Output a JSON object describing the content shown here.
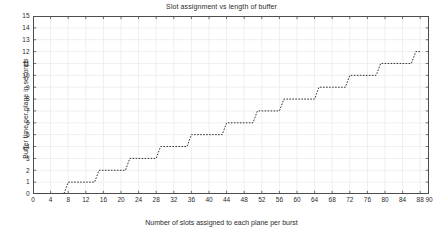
{
  "chart_data": {
    "type": "line",
    "title": "Slot assignment vs length of buffer",
    "xlabel": "Number of slots assigned to each plane per burst",
    "ylabel": "Buffer time per plane in seconds",
    "xlim": [
      0,
      90
    ],
    "ylim": [
      0,
      15
    ],
    "xticks": [
      0,
      4,
      8,
      12,
      16,
      20,
      24,
      28,
      32,
      36,
      40,
      44,
      48,
      52,
      56,
      60,
      64,
      68,
      72,
      76,
      80,
      84,
      88,
      90
    ],
    "yticks": [
      0,
      1,
      2,
      3,
      4,
      5,
      6,
      7,
      8,
      9,
      10,
      11,
      12,
      13,
      14,
      15
    ],
    "grid": true,
    "legend": null,
    "line_style": "dotted-staircase",
    "line_color": "#333333",
    "series": [
      {
        "name": "buffer time",
        "x": [
          1,
          2,
          3,
          4,
          5,
          6,
          7,
          8,
          9,
          10,
          11,
          12,
          13,
          14,
          15,
          16,
          17,
          18,
          19,
          20,
          21,
          22,
          23,
          24,
          25,
          26,
          27,
          28,
          29,
          30,
          31,
          32,
          33,
          34,
          35,
          36,
          37,
          38,
          39,
          40,
          41,
          42,
          43,
          44,
          45,
          46,
          47,
          48,
          49,
          50,
          51,
          52,
          53,
          54,
          55,
          56,
          57,
          58,
          59,
          60,
          61,
          62,
          63,
          64,
          65,
          66,
          67,
          68,
          69,
          70,
          71,
          72,
          73,
          74,
          75,
          76,
          77,
          78,
          79,
          80,
          81,
          82,
          83,
          84,
          85,
          86,
          87,
          88
        ],
        "y": [
          0,
          0,
          0,
          0,
          0,
          0,
          0,
          1,
          1,
          1,
          1,
          1,
          1,
          1,
          2,
          2,
          2,
          2,
          2,
          2,
          2,
          3,
          3,
          3,
          3,
          3,
          3,
          3,
          4,
          4,
          4,
          4,
          4,
          4,
          4,
          5,
          5,
          5,
          5,
          5,
          5,
          5,
          5,
          6,
          6,
          6,
          6,
          6,
          6,
          6,
          7,
          7,
          7,
          7,
          7,
          7,
          8,
          8,
          8,
          8,
          8,
          8,
          8,
          8,
          9,
          9,
          9,
          9,
          9,
          9,
          9,
          10,
          10,
          10,
          10,
          10,
          10,
          10,
          11,
          11,
          11,
          11,
          11,
          11,
          11,
          11,
          12,
          12
        ]
      }
    ],
    "steps": [
      {
        "level": 0,
        "x_start": 1,
        "x_end": 7
      },
      {
        "level": 1,
        "x_start": 8,
        "x_end": 14
      },
      {
        "level": 2,
        "x_start": 15,
        "x_end": 21
      },
      {
        "level": 3,
        "x_start": 22,
        "x_end": 28
      },
      {
        "level": 4,
        "x_start": 29,
        "x_end": 35
      },
      {
        "level": 5,
        "x_start": 36,
        "x_end": 43
      },
      {
        "level": 6,
        "x_start": 44,
        "x_end": 50
      },
      {
        "level": 7,
        "x_start": 51,
        "x_end": 56
      },
      {
        "level": 8,
        "x_start": 57,
        "x_end": 64
      },
      {
        "level": 9,
        "x_start": 65,
        "x_end": 71
      },
      {
        "level": 10,
        "x_start": 72,
        "x_end": 78
      },
      {
        "level": 11,
        "x_start": 79,
        "x_end": 86
      },
      {
        "level": 12,
        "x_start": 87,
        "x_end": 88
      }
    ]
  },
  "figure": {
    "background_color": "#ffffff",
    "axis_color": "#4d4d4d",
    "grid_color": "#efefef",
    "text_color": "#2b2b2b"
  }
}
